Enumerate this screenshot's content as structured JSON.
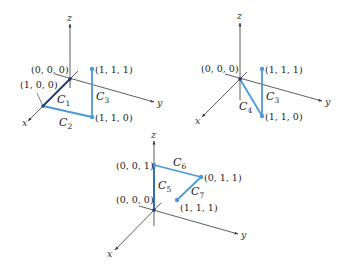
{
  "colors": {
    "axis": "#333333",
    "curve_light": "#4a9ad8",
    "curve_dark": "#1f3f70",
    "curve_mid": "#2f6fb0",
    "point": "#4a9ad8"
  },
  "panels": [
    {
      "id": "panel-1",
      "axes": {
        "x": "x",
        "y": "y",
        "z": "z"
      },
      "points": [
        {
          "label": "(0, 0, 0)"
        },
        {
          "label": "(1, 0, 0)"
        },
        {
          "label": "(1, 1, 0)"
        },
        {
          "label": "(1, 1, 1)"
        }
      ],
      "curves": [
        {
          "name": "C",
          "sub": "1"
        },
        {
          "name": "C",
          "sub": "2"
        },
        {
          "name": "C",
          "sub": "3"
        }
      ]
    },
    {
      "id": "panel-2",
      "axes": {
        "x": "x",
        "y": "y",
        "z": "z"
      },
      "points": [
        {
          "label": "(0, 0, 0)"
        },
        {
          "label": "(1, 1, 1)"
        },
        {
          "label": "(1, 1, 0)"
        }
      ],
      "curves": [
        {
          "name": "C",
          "sub": "4"
        },
        {
          "name": "C",
          "sub": "3"
        }
      ]
    },
    {
      "id": "panel-3",
      "axes": {
        "x": "x",
        "y": "y",
        "z": "z"
      },
      "points": [
        {
          "label": "(0, 0, 1)"
        },
        {
          "label": "(0, 1, 1)"
        },
        {
          "label": "(0, 0, 0)"
        },
        {
          "label": "(1, 1, 1)"
        }
      ],
      "curves": [
        {
          "name": "C",
          "sub": "5"
        },
        {
          "name": "C",
          "sub": "6"
        },
        {
          "name": "C",
          "sub": "7"
        }
      ]
    }
  ]
}
